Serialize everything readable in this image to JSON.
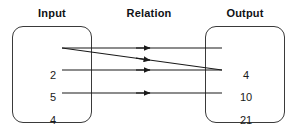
{
  "diagram": {
    "type": "relation-mapping",
    "headers": {
      "input": "Input",
      "relation": "Relation",
      "output": "Output"
    },
    "input_set": {
      "values": [
        "2",
        "5",
        "4"
      ]
    },
    "output_set": {
      "values": [
        "4",
        "10",
        "21"
      ]
    },
    "mappings": [
      {
        "from": "2",
        "to": "4",
        "kind": "horizontal"
      },
      {
        "from": "2",
        "to": "10",
        "kind": "diagonal"
      },
      {
        "from": "5",
        "to": "10",
        "kind": "horizontal"
      },
      {
        "from": "4",
        "to": "21",
        "kind": "horizontal"
      }
    ],
    "colors": {
      "box_stroke": "#3a3a3a",
      "arrow_stroke": "#1a1a1a",
      "text": "#1a1a1a",
      "header_text": "#0f1115",
      "background": "#ffffff"
    }
  }
}
